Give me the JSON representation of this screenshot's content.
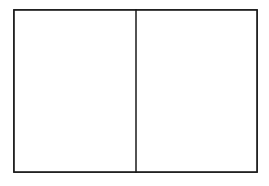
{
  "figure": {
    "type": "two-panel-diagram",
    "caption": "",
    "background_color": "#ffffff",
    "ink_color": "#111111",
    "frame_color": "#1a1a1a",
    "width": 269,
    "height": 186
  },
  "frame": {
    "x": 14,
    "y": 10,
    "width": 243,
    "height": 162,
    "stroke_width": 1.6
  },
  "divider": {
    "orientation": "vertical",
    "x": 136,
    "y_top": 10,
    "y_bottom": 172,
    "stroke_width": 1.5
  },
  "panels": [
    {
      "id": "left-panel",
      "label": "",
      "content": "empty",
      "x": 14,
      "y": 10,
      "width": 122,
      "height": 162
    },
    {
      "id": "right-panel",
      "label": "",
      "content": "squiggle-curve",
      "x": 136,
      "y": 10,
      "width": 121,
      "height": 162
    }
  ],
  "squiggle": {
    "description": "continuous meandering self-crossing curve with small loops",
    "loop_count": 7,
    "stroke_width": 1.9,
    "loops": [
      {
        "cx": 158,
        "cy": 16,
        "r": 4
      },
      {
        "cx": 242,
        "cy": 35,
        "r": 6
      },
      {
        "cx": 158,
        "cy": 69,
        "r": 5
      },
      {
        "cx": 213,
        "cy": 78,
        "r": 6
      },
      {
        "cx": 224,
        "cy": 95,
        "r": 6
      },
      {
        "cx": 228,
        "cy": 133,
        "r": 7
      },
      {
        "cx": 194,
        "cy": 147,
        "r": 6
      }
    ],
    "path_d": "M157.5,13.2 C161.4,12.6 163.3,16.2 161.2,18.8 C159.0,21.5 155.2,19.6 155.6,16.6 C155.9,13.9 158.6,13.0 160.6,14.6 C163.2,16.6 163.0,21.0 162.4,24.6 C161.7,28.8 160.0,32.0 161.9,35.1 C164.4,39.2 171.0,38.4 176.4,36.2 C182.1,33.9 187.0,30.0 192.0,28.8 C196.3,27.8 199.6,29.5 200.2,33.4 C200.9,38.0 197.3,42.5 192.0,46.6 C186.2,51.0 178.6,54.6 172.0,58.8 C166.8,62.1 162.5,65.1 160.3,68.0 C158.0,71.0 158.0,73.8 160.0,75.0 C162.1,76.3 164.6,74.4 164.6,71.4 C164.6,68.2 161.6,65.5 157.8,64.0 C153.2,62.2 148.2,62.2 145.0,64.8 C141.8,67.5 141.6,72.2 144.3,76.0 C147.4,80.4 153.4,82.8 160.2,82.6 C168.0,82.4 176.5,79.2 183.6,74.2 C190.8,69.0 196.2,62.4 201.0,56.0 C205.3,50.3 209.0,44.8 213.4,41.2 C217.2,38.0 221.4,36.6 225.4,38.0 C229.2,39.3 231.2,42.8 234.0,44.4 C236.9,46.0 240.2,45.2 242.4,42.6 C244.7,39.9 245.0,35.8 243.2,33.0 C241.4,30.2 237.8,29.6 235.6,31.8 C233.4,34.0 233.8,37.8 236.4,40.6 C239.1,43.4 243.2,45.0 246.6,46.8 C249.9,48.6 252.4,50.8 252.8,54.0 C253.2,57.6 250.6,60.6 246.8,61.4 C242.6,62.3 237.6,60.6 233.0,59.4 C228.0,58.0 223.4,57.4 219.4,59.2 C215.2,61.1 212.4,65.4 210.6,70.0 C209.0,74.0 208.4,78.0 206.0,80.0 C203.8,81.9 200.6,81.2 199.4,78.4 C198.2,75.6 199.6,72.0 202.6,70.4 C205.8,68.7 210.0,69.6 212.6,72.4 C215.4,75.4 216.2,80.0 215.0,84.4 C213.8,88.8 210.8,92.6 207.0,95.0 C203.0,97.6 198.2,98.4 194.8,96.6 C191.5,94.8 190.2,91.0 191.6,87.8 C193.0,84.6 196.8,83.0 199.8,84.6 C202.9,86.2 204.2,90.2 203.0,94.0 C201.8,97.9 198.4,101.0 194.0,104.0 C189.2,107.2 183.4,110.0 178.6,113.6 C173.4,117.4 169.4,122.0 164.6,124.6 C160.2,127.0 155.2,127.2 152.2,124.4 C149.1,121.5 149.4,116.4 152.4,112.0 C155.6,107.3 161.2,103.6 166.4,99.6 C171.6,95.6 176.4,91.4 178.0,87.0 C179.4,83.2 178.0,79.8 174.8,79.0 C171.7,78.2 168.4,80.4 168.0,83.6 C167.6,86.9 170.2,89.8 174.0,90.2 C178.0,90.6 182.6,88.6 186.6,85.8 C190.8,82.8 194.4,79.0 198.6,76.6 C202.6,74.3 206.8,73.6 210.2,75.2 C213.5,76.8 215.2,80.2 217.4,82.4 C219.6,84.6 222.6,85.4 225.4,84.0 C228.3,82.6 230.0,79.4 229.4,76.4 C228.8,73.4 225.8,71.6 223.0,72.6 C220.1,73.6 218.8,77.0 220.0,80.2 C221.2,83.5 224.6,85.8 228.6,87.6 C232.8,89.5 237.4,91.0 240.4,93.8 C243.3,96.5 244.2,100.4 242.4,104.2 C240.5,108.2 235.8,111.6 231.4,115.0 C227.0,118.4 222.8,121.8 221.6,125.6 C220.5,129.2 222.2,132.8 225.6,133.8 C229.0,134.8 232.6,132.6 233.0,129.2 C233.4,125.7 230.2,122.6 226.4,122.8 C222.4,123.0 218.8,126.2 216.4,130.0 C213.8,134.0 212.2,138.6 209.0,141.6 C206.0,144.4 201.8,145.2 198.6,143.2 C195.3,141.1 194.0,136.8 195.8,133.4 C197.6,130.0 201.8,129.0 204.2,131.4 C206.7,133.9 206.0,138.4 203.0,141.4 C199.8,144.6 194.6,146.2 189.6,146.6 C184.2,147.0 179.0,146.2 174.4,147.2 C169.6,148.2 165.4,151.0 162.0,154.2 C158.4,157.6 155.6,161.4 152.0,163.2 C148.6,164.9 144.6,164.4 142.4,161.6 C140.1,158.7 140.6,154.2 143.4,151.6 C146.3,148.9 150.8,148.6 154.4,150.4 C158.2,152.3 160.8,156.0 164.4,158.6 C168.2,161.3 173.0,162.8 178.0,162.2 C183.2,161.6 188.4,158.8 193.8,155.6 C199.4,152.3 205.2,148.6 210.4,146.0 C215.4,143.5 219.8,142.0 223.6,142.6 C227.2,143.2 229.8,145.8 233.0,147.8 C236.1,149.7 240.0,150.8 243.2,149.0 C246.3,147.3 248.0,143.0 247.6,138.4 C247.2,133.6 244.8,128.6 243.0,123.6 C241.2,118.6 240.0,113.6 241.2,109.6 C242.4,105.8 245.6,103.2 249.2,102.8 C252.0,102.5 254.2,103.6 255.6,105.0"
  }
}
